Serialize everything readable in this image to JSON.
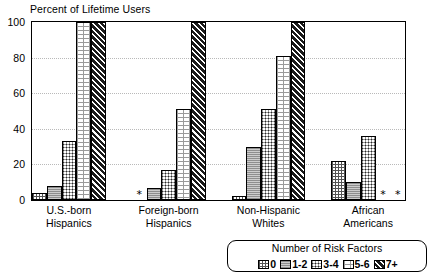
{
  "chart_data": {
    "type": "bar",
    "title": "Percent of Lifetime Users",
    "xlabel": "",
    "ylabel": "",
    "ylim": [
      0,
      100
    ],
    "yticks": [
      0,
      20,
      40,
      60,
      80,
      100
    ],
    "grid": true,
    "legend_position": "bottom-right",
    "legend_title": "Number of Risk Factors",
    "categories": [
      "U.S.-born Hispanics",
      "Foreign-born Hispanics",
      "Non-Hispanic Whites",
      "African Americans"
    ],
    "category_lines": [
      [
        "U.S.-born",
        "Hispanics"
      ],
      [
        "Foreign-born",
        "Hispanics"
      ],
      [
        "Non-Hispanic",
        "Whites"
      ],
      [
        "African",
        "Americans"
      ]
    ],
    "series": [
      {
        "name": "0",
        "values": [
          4,
          null,
          2,
          22
        ]
      },
      {
        "name": "1-2",
        "values": [
          8,
          7,
          30,
          10
        ]
      },
      {
        "name": "3-4",
        "values": [
          33,
          17,
          51,
          36
        ]
      },
      {
        "name": "5-6",
        "values": [
          100,
          51,
          81,
          null
        ]
      },
      {
        "name": "7+",
        "values": [
          100,
          100,
          100,
          null
        ]
      }
    ],
    "suppressed_marker": "*",
    "suppressed_cells": [
      {
        "category": "Foreign-born Hispanics",
        "series": "0"
      },
      {
        "category": "African Americans",
        "series": "5-6"
      }
    ],
    "colors": {
      "axis": "#000000",
      "grid": "#b9b9b9",
      "background": "#ffffff",
      "series_0": "#ffffff",
      "series_1_2": "#8e8e8e",
      "series_3_4": "#ffffff",
      "series_5_6": "#ffffff",
      "series_7plus": "#1a1a1a"
    }
  },
  "ytick_labels": [
    "100",
    "80",
    "60",
    "40",
    "20",
    "0"
  ],
  "legend": {
    "title": "Number of Risk Factors",
    "items": [
      {
        "label": "0"
      },
      {
        "label": "1-2"
      },
      {
        "label": "3-4"
      },
      {
        "label": "5-6"
      },
      {
        "label": "7+"
      }
    ]
  }
}
